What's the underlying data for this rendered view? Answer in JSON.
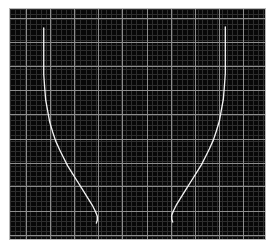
{
  "plot": {
    "title": "",
    "background_color": "#080808",
    "border_color": "#b9b9b9",
    "page_background": "#ffffff",
    "minor_grid_color": "#2e2e2e",
    "major_grid_color": "#8e8e8e",
    "trace_color": "#f2f2f2",
    "area": {
      "left": 9,
      "top": 8,
      "width": 257,
      "height": 232
    }
  },
  "chart_data": {
    "type": "line",
    "title": "",
    "xlabel": "",
    "ylabel": "",
    "xlim": [
      0,
      257
    ],
    "ylim": [
      0,
      232
    ],
    "grid": true,
    "minor_grid": true,
    "legend": "none",
    "tick_labels_visible": false,
    "axis_labels_visible": false,
    "minor_grid_spacing_px": 5.1,
    "major_grid_spacing_px": 24.4,
    "major_gridlines_x": [
      16,
      40,
      65,
      89,
      113,
      138,
      162,
      186,
      211,
      235
    ],
    "major_gridlines_y": [
      9,
      33,
      58,
      82,
      106,
      131,
      155,
      179,
      204,
      228
    ],
    "series": [
      {
        "name": "left-curve",
        "points": [
          [
            34,
            19
          ],
          [
            34,
            26
          ],
          [
            34,
            38
          ],
          [
            34,
            52
          ],
          [
            34,
            66
          ],
          [
            35,
            80
          ],
          [
            36,
            92
          ],
          [
            38,
            103
          ],
          [
            40,
            114
          ],
          [
            43,
            124
          ],
          [
            46,
            133
          ],
          [
            50,
            142
          ],
          [
            54,
            150
          ],
          [
            58,
            158
          ],
          [
            63,
            166
          ],
          [
            68,
            174
          ],
          [
            73,
            182
          ],
          [
            78,
            190
          ],
          [
            83,
            198
          ],
          [
            86,
            204
          ],
          [
            88,
            209
          ],
          [
            88,
            213
          ],
          [
            87,
            216
          ]
        ]
      },
      {
        "name": "right-curve",
        "points": [
          [
            217,
            18
          ],
          [
            217,
            25
          ],
          [
            217,
            37
          ],
          [
            217,
            51
          ],
          [
            217,
            65
          ],
          [
            216,
            79
          ],
          [
            215,
            91
          ],
          [
            213,
            102
          ],
          [
            211,
            113
          ],
          [
            208,
            123
          ],
          [
            205,
            132
          ],
          [
            201,
            141
          ],
          [
            197,
            149
          ],
          [
            193,
            157
          ],
          [
            188,
            165
          ],
          [
            183,
            173
          ],
          [
            178,
            181
          ],
          [
            173,
            189
          ],
          [
            168,
            197
          ],
          [
            165,
            203
          ],
          [
            163,
            208
          ],
          [
            163,
            212
          ],
          [
            164,
            215
          ]
        ]
      }
    ]
  }
}
